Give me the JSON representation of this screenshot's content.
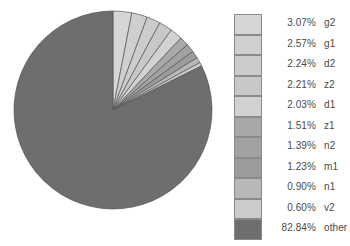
{
  "chart_data": {
    "type": "pie",
    "title": "",
    "start_angle_deg": 0,
    "direction": "clockwise",
    "legend_position": "right",
    "center": {
      "x": 113,
      "y": 110
    },
    "radius": 99,
    "categories": [
      "g2",
      "g1",
      "d2",
      "z2",
      "d1",
      "z1",
      "n2",
      "m1",
      "n1",
      "v2",
      "other"
    ],
    "values": [
      3.07,
      2.57,
      2.24,
      2.21,
      2.03,
      1.51,
      1.39,
      1.23,
      0.9,
      0.6,
      82.84
    ],
    "value_labels": [
      "3.07%",
      "2.57%",
      "2.24%",
      "2.21%",
      "2.03%",
      "1.51%",
      "1.39%",
      "1.23%",
      "0.90%",
      "0.60%",
      "82.84%"
    ],
    "unit": "%",
    "colors": [
      "#d6d6d6",
      "#cfcfcf",
      "#cccccc",
      "#c8c8c8",
      "#d2d2d2",
      "#a8a8a8",
      "#a2a2a2",
      "#9c9c9c",
      "#b8b8b8",
      "#cbcbcb",
      "#6e6e6e"
    ],
    "slice_border_color": "#555555"
  },
  "legend": {
    "rows": [
      {
        "pct": "3.07%",
        "label": "g2",
        "color": "#d6d6d6"
      },
      {
        "pct": "2.57%",
        "label": "g1",
        "color": "#cfcfcf"
      },
      {
        "pct": "2.24%",
        "label": "d2",
        "color": "#cccccc"
      },
      {
        "pct": "2.21%",
        "label": "z2",
        "color": "#c8c8c8"
      },
      {
        "pct": "2.03%",
        "label": "d1",
        "color": "#d2d2d2"
      },
      {
        "pct": "1.51%",
        "label": "z1",
        "color": "#a8a8a8"
      },
      {
        "pct": "1.39%",
        "label": "n2",
        "color": "#a2a2a2"
      },
      {
        "pct": "1.23%",
        "label": "m1",
        "color": "#9c9c9c"
      },
      {
        "pct": "0.90%",
        "label": "n1",
        "color": "#b8b8b8"
      },
      {
        "pct": "0.60%",
        "label": "v2",
        "color": "#cbcbcb"
      },
      {
        "pct": "82.84%",
        "label": "other",
        "color": "#6e6e6e"
      }
    ]
  }
}
